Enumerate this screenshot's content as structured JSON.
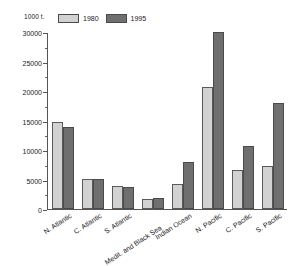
{
  "chart_data": {
    "type": "bar",
    "title": "",
    "subtitle": "",
    "unit_label": "1000 t.",
    "xlabel": "",
    "ylabel": "",
    "ylim": [
      0,
      30000
    ],
    "y_ticks": [
      0,
      5000,
      10000,
      15000,
      20000,
      25000,
      30000
    ],
    "y_tick_labels": [
      "0",
      "5000",
      "10000",
      "15000",
      "20000",
      "25000",
      "30000"
    ],
    "y_minor_ticks": [
      2500,
      7500,
      12500,
      17500,
      22500,
      27500
    ],
    "grid": false,
    "legend_position": "top-left",
    "categories": [
      "N. Atlantic",
      "C. Atlantic",
      "S. Atlantic",
      "Medit. and Black Sea",
      "Indian Ocean",
      "N. Pacific",
      "C. Pacific",
      "S. Pacific"
    ],
    "series": [
      {
        "name": "1980",
        "color": "#d2d2d2",
        "values": [
          14800,
          5150,
          3900,
          1700,
          4300,
          20600,
          6600,
          7300
        ]
      },
      {
        "name": "1995",
        "color": "#6f6f6f",
        "values": [
          13900,
          5050,
          3800,
          1900,
          7900,
          30000,
          10700,
          18000
        ]
      }
    ]
  },
  "legend": {
    "entries": [
      {
        "label": "1980",
        "swatch": "legend-swatch-1980"
      },
      {
        "label": "1995",
        "swatch": "legend-swatch-1995"
      }
    ]
  },
  "axes": {
    "unit": "1000 t."
  }
}
